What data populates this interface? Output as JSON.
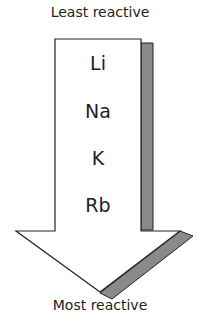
{
  "diagram": {
    "top_label": "Least reactive",
    "bottom_label": "Most reactive",
    "elements": [
      "Li",
      "Na",
      "K",
      "Rb"
    ],
    "colors": {
      "arrow_fill": "#ffffff",
      "shadow": "#8a8a8a",
      "stroke": "#222222"
    }
  }
}
